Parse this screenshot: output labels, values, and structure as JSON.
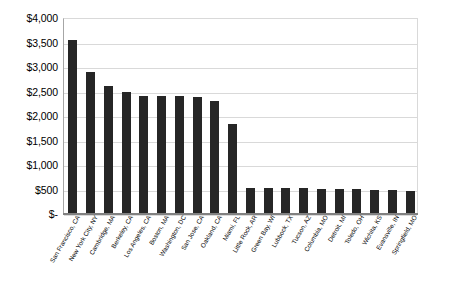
{
  "chart_data": {
    "type": "bar",
    "title": "",
    "subtitle": "",
    "xlabel": "",
    "ylabel": "",
    "ylim": [
      0,
      4000
    ],
    "ytick_step": 500,
    "grid": true,
    "legend": false,
    "legend_position": "none",
    "bar_color": "#262626",
    "gridline_color": "#d9d9d9",
    "axis_color": "#808080",
    "background_color": "#ffffff",
    "ytick_labels": [
      "$4,000",
      "$3,500",
      "$3,000",
      "$2,500",
      "$2,000",
      "$1,500",
      "$1,000",
      "$500",
      "$-"
    ],
    "ytick_values": [
      4000,
      3500,
      3000,
      2500,
      2000,
      1500,
      1000,
      500,
      0
    ],
    "categories": [
      "San Francisco, CA",
      "New York City, NY",
      "Cambridge, MA",
      "Berkeley, CA",
      "Los Angeles, CA",
      "Boston, MA",
      "Washington, DC",
      "San Jose, CA",
      "Oakland, CA",
      "Miami, FL",
      "Little Rock, AR",
      "Green Bay, WI",
      "Lubbock, TX",
      "Tucson, AZ",
      "Columbia, MO",
      "Detroit, MI",
      "Toledo, OH",
      "Wichita, KS",
      "Evansville, IN",
      "Springfield, MO"
    ],
    "values": [
      3550,
      2890,
      2620,
      2480,
      2400,
      2400,
      2400,
      2390,
      2300,
      1830,
      540,
      540,
      540,
      530,
      520,
      510,
      505,
      500,
      490,
      470
    ]
  }
}
